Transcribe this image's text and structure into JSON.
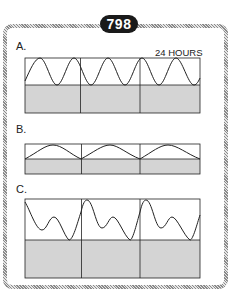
{
  "badge": "798",
  "panels": [
    {
      "label": "A.",
      "annotation": "24 HOURS",
      "description": "Large-amplitude regular oscillation, ~5.5 cycles over three 24-hour segments"
    },
    {
      "label": "B.",
      "annotation": "",
      "description": "Low-amplitude regular oscillation, one cycle per 24-hour segment"
    },
    {
      "label": "C.",
      "annotation": "",
      "description": "Large-amplitude bimodal oscillation, one complex cycle (peak, dip, secondary peak, trough) per 24-hour segment"
    }
  ],
  "segments_per_panel": 3,
  "colors": {
    "fill": "#d4d4d4",
    "line": "#222222",
    "badge": "#1a1a1a",
    "frame": "#9a9a9a"
  }
}
